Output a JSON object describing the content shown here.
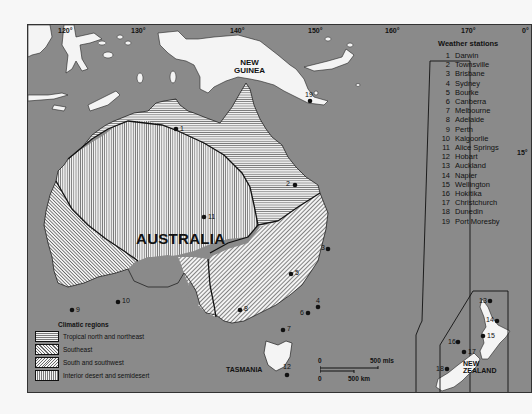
{
  "map": {
    "longitudes": [
      {
        "label": "120°",
        "x": 30
      },
      {
        "label": "130°",
        "x": 103
      },
      {
        "label": "140°",
        "x": 232
      },
      {
        "label": "150°",
        "x": 280
      },
      {
        "label": "160°",
        "x": 357
      },
      {
        "label": "170°",
        "x": 433
      },
      {
        "label": "0°",
        "x": 494
      }
    ],
    "latitude_label": "15°",
    "places": {
      "new_guinea": "NEW\nGUINEA",
      "australia": "AUSTRALIA",
      "tasmania": "TASMANIA",
      "new_zealand": "NEW\nZEALAND"
    },
    "colors": {
      "sea": "#8a8a8a",
      "land": "#f4f4f4",
      "ink": "#111111",
      "page": "#f7f7f7"
    }
  },
  "weather_stations": {
    "title": "Weather stations",
    "items": [
      {
        "num": "1",
        "name": "Darwin"
      },
      {
        "num": "2",
        "name": "Townsville"
      },
      {
        "num": "3",
        "name": "Brisbane"
      },
      {
        "num": "4",
        "name": "Sydney"
      },
      {
        "num": "5",
        "name": "Bourke"
      },
      {
        "num": "6",
        "name": "Canberra"
      },
      {
        "num": "7",
        "name": "Melbourne"
      },
      {
        "num": "8",
        "name": "Adelaide"
      },
      {
        "num": "9",
        "name": "Perth"
      },
      {
        "num": "10",
        "name": "Kalgoorlie"
      },
      {
        "num": "11",
        "name": "Alice Springs"
      },
      {
        "num": "12",
        "name": "Hobart"
      },
      {
        "num": "13",
        "name": "Auckland"
      },
      {
        "num": "14",
        "name": "Napier"
      },
      {
        "num": "15",
        "name": "Wellington"
      },
      {
        "num": "16",
        "name": "Hokitika"
      },
      {
        "num": "17",
        "name": "Christchurch"
      },
      {
        "num": "18",
        "name": "Dunedin"
      },
      {
        "num": "19",
        "name": "Port Moresby"
      }
    ]
  },
  "legend": {
    "title": "Climatic regions",
    "items": [
      {
        "label": "Tropical north and northeast",
        "pattern": "horizontal-lines"
      },
      {
        "label": "Southeast",
        "pattern": "diagonal-lines"
      },
      {
        "label": "South and southwest",
        "pattern": "fine-diagonal-lines"
      },
      {
        "label": "Interior desert and semidesert",
        "pattern": "vertical-lines"
      }
    ]
  },
  "scale": {
    "zero_top": "0",
    "miles": "500 mls",
    "zero_bottom": "0",
    "km": "500 km"
  }
}
